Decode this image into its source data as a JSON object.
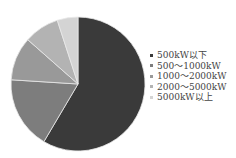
{
  "chart_data": {
    "type": "pie",
    "title": "",
    "categories": [
      "500kW以下",
      "500～1000kW",
      "1000～2000kW",
      "2000～5000kW",
      "5000kW以上"
    ],
    "values": [
      58.5,
      17.5,
      10.5,
      8.5,
      5.0
    ],
    "colors": [
      "#3a3a3a",
      "#7d7d7d",
      "#999999",
      "#b3b3b3",
      "#d4d4d4"
    ],
    "start_angle_deg": 0,
    "direction": "clockwise",
    "legend_position": "right"
  },
  "legend": {
    "items": [
      {
        "label": "500kW以下",
        "color": "#3a3a3a"
      },
      {
        "label": "500～1000kW",
        "color": "#7d7d7d"
      },
      {
        "label": "1000～2000kW",
        "color": "#999999"
      },
      {
        "label": "2000～5000kW",
        "color": "#b3b3b3"
      },
      {
        "label": "5000kW以上",
        "color": "#d4d4d4"
      }
    ]
  }
}
